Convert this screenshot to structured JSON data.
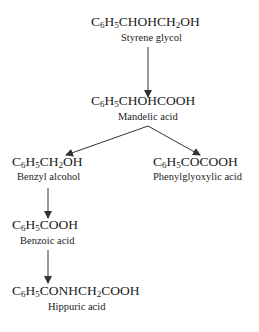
{
  "diagram": {
    "type": "metabolic pathway",
    "nodes": [
      {
        "id": "styrene_glycol",
        "formula_parts": [
          "C",
          "6",
          "H",
          "5",
          "CHOHCH",
          "2",
          "OH"
        ],
        "label": "Styrene glycol"
      },
      {
        "id": "mandelic_acid",
        "formula_parts": [
          "C",
          "6",
          "H",
          "5",
          "CHOHCOOH"
        ],
        "label": "Mandelic acid"
      },
      {
        "id": "benzyl_alcohol",
        "formula_parts": [
          "C",
          "6",
          "H",
          "5",
          "CH",
          "2",
          "OH"
        ],
        "label": "Benzyl alcohol"
      },
      {
        "id": "phenylglyoxylic_acid",
        "formula_parts": [
          "C",
          "6",
          "H",
          "5",
          "COCOOH"
        ],
        "label": "Phenylglyoxylic acid"
      },
      {
        "id": "benzoic_acid",
        "formula_parts": [
          "C",
          "6",
          "H",
          "5",
          "COOH"
        ],
        "label": "Benzoic acid"
      },
      {
        "id": "hippuric_acid",
        "formula_parts": [
          "C",
          "6",
          "H",
          "5",
          "CONHCH",
          "2",
          "COOH"
        ],
        "label": "Hippuric acid"
      }
    ],
    "edges": [
      {
        "from": "styrene_glycol",
        "to": "mandelic_acid"
      },
      {
        "from": "mandelic_acid",
        "to": "benzyl_alcohol"
      },
      {
        "from": "mandelic_acid",
        "to": "phenylglyoxylic_acid"
      },
      {
        "from": "benzyl_alcohol",
        "to": "benzoic_acid"
      },
      {
        "from": "benzoic_acid",
        "to": "hippuric_acid"
      }
    ],
    "colors": {
      "line": "#333333",
      "text": "#1a1a1a",
      "background": "#ffffff"
    }
  }
}
